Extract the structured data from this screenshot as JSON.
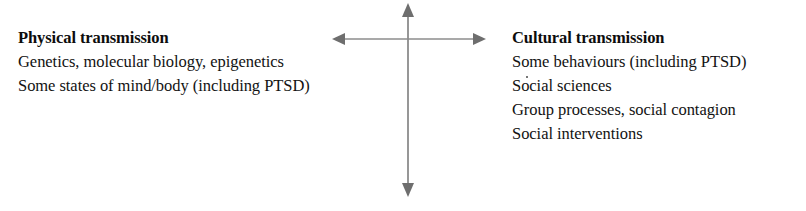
{
  "figure": {
    "background_color": "#ffffff",
    "arrow_color": "#7d7d7d",
    "text_color": "#121212",
    "heading_color": "#0d0d0d"
  },
  "left_column": {
    "heading": "Physical transmission",
    "lines": [
      "Genetics, molecular biology, epigenetics",
      "Some states of mind/body (including PTSD)"
    ]
  },
  "right_column": {
    "heading": "Cultural transmission",
    "lines": [
      "Some behaviours (including PTSD)",
      "Social sciences",
      "Group processes, social contagion",
      "Social interventions"
    ]
  },
  "cross_arrows": {
    "horizontal_label": "horizontal-double-arrow",
    "vertical_label": "vertical-double-arrow",
    "icons": [
      "arrow-left-icon",
      "arrow-right-icon",
      "arrow-up-icon",
      "arrow-down-icon"
    ]
  }
}
